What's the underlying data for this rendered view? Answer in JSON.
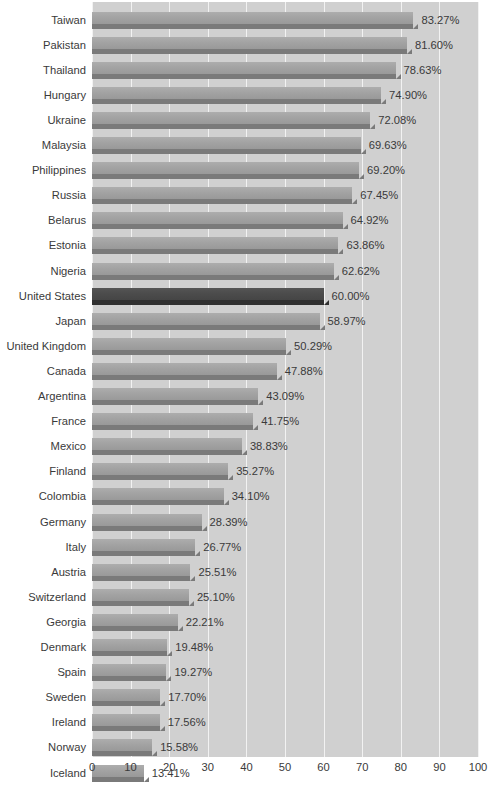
{
  "chart_data": {
    "type": "bar",
    "orientation": "horizontal",
    "title": "",
    "subtitle": "",
    "xlabel": "",
    "ylabel": "",
    "xlim": [
      0,
      100
    ],
    "grid": true,
    "legend": null,
    "value_suffix": "%",
    "highlight_category": "United States",
    "xticks": [
      "0",
      "10",
      "20",
      "30",
      "40",
      "50",
      "60",
      "70",
      "80",
      "90",
      "100"
    ],
    "xtick_values": [
      0,
      10,
      20,
      30,
      40,
      50,
      60,
      70,
      80,
      90,
      100
    ],
    "categories": [
      "Taiwan",
      "Pakistan",
      "Thailand",
      "Hungary",
      "Ukraine",
      "Malaysia",
      "Philippines",
      "Russia",
      "Belarus",
      "Estonia",
      "Nigeria",
      "United States",
      "Japan",
      "United Kingdom",
      "Canada",
      "Argentina",
      "France",
      "Mexico",
      "Finland",
      "Colombia",
      "Germany",
      "Italy",
      "Austria",
      "Switzerland",
      "Georgia",
      "Denmark",
      "Spain",
      "Sweden",
      "Ireland",
      "Norway",
      "Iceland"
    ],
    "values": [
      83.27,
      81.6,
      78.63,
      74.9,
      72.08,
      69.63,
      69.2,
      67.45,
      64.92,
      63.86,
      62.62,
      60.0,
      58.97,
      50.29,
      47.88,
      43.09,
      41.75,
      38.83,
      35.27,
      34.1,
      28.39,
      26.77,
      25.51,
      25.1,
      22.21,
      19.48,
      19.27,
      17.7,
      17.56,
      15.58,
      13.41
    ],
    "value_labels": [
      "83.27%",
      "81.60%",
      "78.63%",
      "74.90%",
      "72.08%",
      "69.63%",
      "69.20%",
      "67.45%",
      "64.92%",
      "63.86%",
      "62.62%",
      "60.00%",
      "58.97%",
      "50.29%",
      "47.88%",
      "43.09%",
      "41.75%",
      "38.83%",
      "35.27%",
      "34.10%",
      "28.39%",
      "26.77%",
      "25.51%",
      "25.10%",
      "22.21%",
      "19.48%",
      "19.27%",
      "17.70%",
      "17.56%",
      "15.58%",
      "13.41%"
    ]
  },
  "colors": {
    "plot_background": "#d0d0d0",
    "page_background": "#ffffff",
    "gridline": "#f2f2f2",
    "bar": "#a3a3a3",
    "bar_shadow": "#7a7a7a",
    "bar_highlight": "#4c4c4c",
    "bar_highlight_shadow": "#303030",
    "text": "#3a3a3a"
  }
}
